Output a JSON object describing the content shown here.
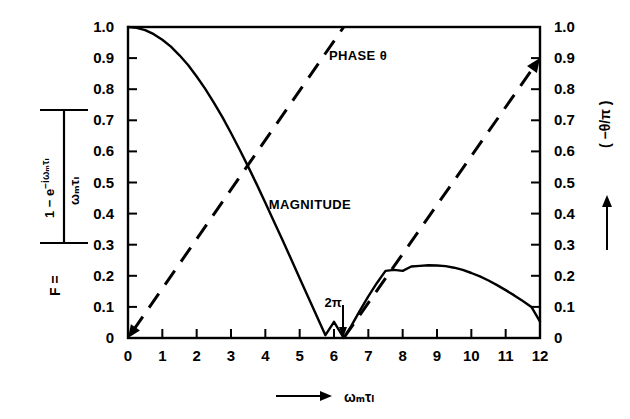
{
  "chart_data": {
    "type": "line",
    "title": "",
    "xlabel": "ωₘτₗ",
    "xlabel_prefix_arrow": "→",
    "ylabel_left": "F = |(1 − e^(−iωₘτₗ)) / (ωₘτₗ)|",
    "ylabel_right": "( −θ/π )",
    "ylabel_right_arrow": "↑",
    "xlim": [
      0,
      12
    ],
    "ylim_left": [
      0,
      1.0
    ],
    "ylim_right": [
      0,
      1.0
    ],
    "grid": false,
    "legend_position": "inline-annotations",
    "xticks": [
      "0",
      "1",
      "2",
      "3",
      "4",
      "5",
      "6",
      "7",
      "8",
      "9",
      "10",
      "11",
      "12"
    ],
    "xtick_values": [
      0,
      1,
      2,
      3,
      4,
      5,
      6,
      7,
      8,
      9,
      10,
      11,
      12
    ],
    "yticks_left": [
      "0",
      "0.1",
      "0.2",
      "0.3",
      "0.4",
      "0.5",
      "0.6",
      "0.7",
      "0.8",
      "0.9",
      "1.0"
    ],
    "ytick_values_left": [
      0,
      0.1,
      0.2,
      0.3,
      0.4,
      0.5,
      0.6,
      0.7,
      0.8,
      0.9,
      1.0
    ],
    "yticks_right": [
      "0",
      "0.1",
      "0.2",
      "0.3",
      "0.4",
      "0.5",
      "0.6",
      "0.7",
      "0.8",
      "0.9",
      "1.0"
    ],
    "ytick_values_right": [
      0,
      0.1,
      0.2,
      0.3,
      0.4,
      0.5,
      0.6,
      0.7,
      0.8,
      0.9,
      1.0
    ],
    "annotations": [
      {
        "name": "phase-label",
        "text": "PHASE θ",
        "x": 6.7,
        "y": 0.91
      },
      {
        "name": "magnitude-label",
        "text": "MAGNITUDE",
        "x": 5.3,
        "y": 0.43
      },
      {
        "name": "zero-crossing-marker",
        "text": "2π",
        "x": 6.283,
        "y": 0.1
      }
    ],
    "series": [
      {
        "name": "MAGNITUDE",
        "style": "solid",
        "axis": "left",
        "formula": "|sin(x/2)/(x/2)|",
        "x": [
          0,
          0.25,
          0.5,
          0.75,
          1,
          1.25,
          1.5,
          1.75,
          2,
          2.25,
          2.5,
          2.75,
          3,
          3.25,
          3.5,
          3.75,
          4,
          4.25,
          4.5,
          4.75,
          5,
          5.25,
          5.5,
          5.75,
          6,
          6.283,
          6.5,
          6.75,
          7,
          7.25,
          7.5,
          7.75,
          8,
          8.25,
          8.5,
          8.75,
          9,
          9.25,
          9.5,
          9.75,
          10,
          10.25,
          10.5,
          10.75,
          11,
          11.25,
          11.5,
          11.75,
          12
        ],
        "y": [
          1.0,
          0.997,
          0.99,
          0.977,
          0.959,
          0.937,
          0.909,
          0.878,
          0.841,
          0.801,
          0.757,
          0.71,
          0.659,
          0.606,
          0.551,
          0.494,
          0.435,
          0.375,
          0.315,
          0.254,
          0.192,
          0.131,
          0.07,
          0.009,
          0.052,
          0.0,
          0.038,
          0.087,
          0.134,
          0.177,
          0.216,
          0.219,
          0.216,
          0.23,
          0.232,
          0.234,
          0.233,
          0.231,
          0.226,
          0.219,
          0.209,
          0.198,
          0.185,
          0.17,
          0.154,
          0.137,
          0.119,
          0.1,
          0.053
        ]
      },
      {
        "name": "PHASE θ",
        "style": "dashed",
        "axis": "right",
        "formula": "(-θ/π) = x/(4π) sawtooth, reset at 2π",
        "segments": [
          {
            "x_start": 0,
            "y_start": 0.0,
            "x_end": 6.283,
            "y_end": 1.0,
            "arrow_start": true
          },
          {
            "x_start": 6.283,
            "y_start": 0.0,
            "x_end": 12.0,
            "y_end": 0.9,
            "arrow_end": true
          }
        ]
      }
    ],
    "key_points": {
      "first_zero": {
        "x": 6.283,
        "label": "2π",
        "y": 0.0
      },
      "second_lobe_peak": {
        "x": 9.0,
        "y": 0.232
      },
      "curve_crossing": {
        "x": 3.5,
        "y": 0.56
      },
      "value_at_xmax": {
        "x": 12.0,
        "y": 0.053
      }
    }
  },
  "ylabel_left_parts": {
    "F_eq": "F =",
    "numerator": "1 − e",
    "numerator_exp": "−iωₘτₗ",
    "denominator": "ωₘτₗ"
  },
  "colors": {
    "background": "#ffffff",
    "ink": "#000000",
    "curve": "#000000"
  }
}
